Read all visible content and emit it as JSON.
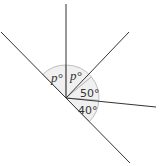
{
  "diagram": {
    "type": "angles-at-a-point",
    "vertex": {
      "x": 66,
      "y": 98
    },
    "angles": [
      {
        "id": "angle-left-p",
        "label": "p°"
      },
      {
        "id": "angle-right-p",
        "label": "p°"
      },
      {
        "id": "angle-50",
        "label": "50°"
      },
      {
        "id": "angle-40",
        "label": "40°"
      }
    ],
    "colors": {
      "line": "#333333",
      "arc_fill": "#f0f0f0",
      "arc_stroke": "#b0b0b0"
    }
  }
}
